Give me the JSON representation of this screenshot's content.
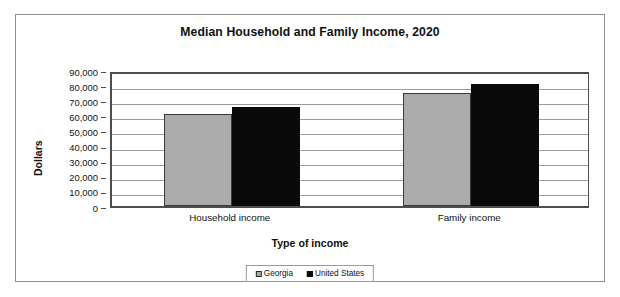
{
  "figure": {
    "title": "Median Household and Family Income, 2020"
  },
  "chart_data": {
    "type": "bar",
    "title": "Median Household and Family Income, 2020",
    "xlabel": "Type of income",
    "ylabel": "Dollars",
    "categories": [
      "Household income",
      "Family income"
    ],
    "series": [
      {
        "name": "Georgia",
        "color": "#ababab",
        "values": [
          61200,
          74700
        ]
      },
      {
        "name": "United States",
        "color": "#0a0a0a",
        "values": [
          65700,
          80700
        ]
      }
    ],
    "ylim": [
      0,
      90000
    ],
    "ytick_values": [
      0,
      10000,
      20000,
      30000,
      40000,
      50000,
      60000,
      70000,
      80000,
      90000
    ],
    "ytick_labels": [
      "0",
      "10,000",
      "20,000",
      "30,000",
      "40,000",
      "50,000",
      "60,000",
      "70,000",
      "80,000",
      "90,000"
    ],
    "grid": true,
    "grid_axis": "y",
    "legend_position": "bottom",
    "legend_entries": [
      "Georgia",
      "United States"
    ]
  }
}
